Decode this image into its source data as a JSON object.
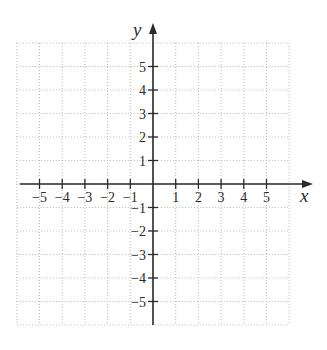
{
  "chart_data": {
    "type": "scatter",
    "title": "",
    "xlabel": "x",
    "ylabel": "y",
    "xlim": [
      -6,
      6
    ],
    "ylim": [
      -6,
      6
    ],
    "grid": true,
    "grid_style": "dotted",
    "x_ticks": [
      -5,
      -4,
      -3,
      -2,
      -1,
      1,
      2,
      3,
      4,
      5
    ],
    "y_ticks": [
      5,
      4,
      3,
      2,
      1,
      -1,
      -2,
      -3,
      -4,
      -5
    ],
    "x_tick_labels": [
      "−5",
      "−4",
      "−3",
      "−2",
      "−1",
      "1",
      "2",
      "3",
      "4",
      "5"
    ],
    "y_tick_labels": [
      "5",
      "4",
      "3",
      "2",
      "1",
      "−1",
      "−2",
      "−3",
      "−4",
      "−5"
    ],
    "series": [],
    "legend": null
  },
  "colors": {
    "axis": "#2a2a2a",
    "grid": "#b8b8b8",
    "background": "#ffffff"
  }
}
